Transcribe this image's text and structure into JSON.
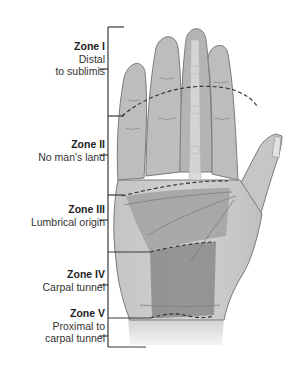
{
  "diagram": {
    "zones": [
      {
        "id": "zone-1",
        "title": "Zone I",
        "description_lines": [
          "Distal",
          "to sublimis"
        ]
      },
      {
        "id": "zone-2",
        "title": "Zone II",
        "description_lines": [
          "No man's land"
        ]
      },
      {
        "id": "zone-3",
        "title": "Zone III",
        "description_lines": [
          "Lumbrical origin"
        ]
      },
      {
        "id": "zone-4",
        "title": "Zone IV",
        "description_lines": [
          "Carpal tunnel"
        ]
      },
      {
        "id": "zone-5",
        "title": "Zone V",
        "description_lines": [
          "Proximal to",
          "carpal tunnel"
        ]
      }
    ],
    "colors": {
      "background": "#ffffff",
      "skin": "#b9b9b9",
      "skin_light": "#d6d6d6",
      "outline": "#7a7a7a",
      "zone_shade": "#8f8f8f",
      "bracket": "#3a3a3a",
      "dashed_boundary": "#2e2e2e"
    }
  }
}
